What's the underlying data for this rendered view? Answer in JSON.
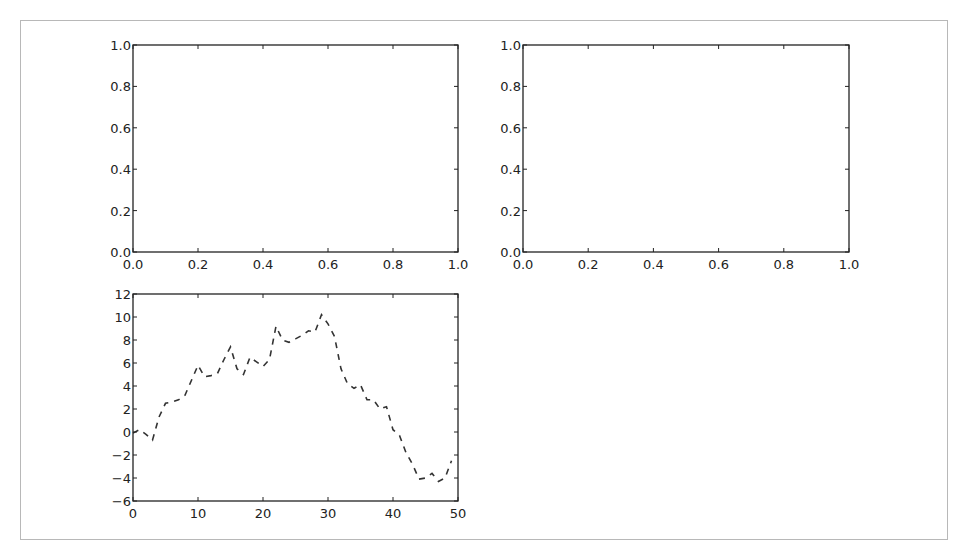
{
  "figure": {
    "layout": "2x2 subplots, bottom-right empty"
  },
  "chart_data": [
    {
      "type": "line",
      "position": "top-left",
      "title": "",
      "xlabel": "",
      "ylabel": "",
      "xlim": [
        0.0,
        1.0
      ],
      "ylim": [
        0.0,
        1.0
      ],
      "xticks": [
        "0.0",
        "0.2",
        "0.4",
        "0.6",
        "0.8",
        "1.0"
      ],
      "yticks": [
        "0.0",
        "0.2",
        "0.4",
        "0.6",
        "0.8",
        "1.0"
      ],
      "series": [],
      "grid": false
    },
    {
      "type": "line",
      "position": "top-right",
      "title": "",
      "xlabel": "",
      "ylabel": "",
      "xlim": [
        0.0,
        1.0
      ],
      "ylim": [
        0.0,
        1.0
      ],
      "xticks": [
        "0.0",
        "0.2",
        "0.4",
        "0.6",
        "0.8",
        "1.0"
      ],
      "yticks": [
        "0.0",
        "0.2",
        "0.4",
        "0.6",
        "0.8",
        "1.0"
      ],
      "series": [],
      "grid": false
    },
    {
      "type": "line",
      "position": "bottom-left",
      "title": "",
      "xlabel": "",
      "ylabel": "",
      "xlim": [
        0,
        50
      ],
      "ylim": [
        -6,
        12
      ],
      "xticks": [
        "0",
        "10",
        "20",
        "30",
        "40",
        "50"
      ],
      "yticks": [
        "-6",
        "-4",
        "-2",
        "0",
        "2",
        "4",
        "6",
        "8",
        "10",
        "12"
      ],
      "grid": false,
      "series": [
        {
          "name": "random walk",
          "style": "dashed",
          "color": "#333333",
          "x": [
            0,
            1,
            2,
            3,
            4,
            5,
            6,
            7,
            8,
            9,
            10,
            11,
            12,
            13,
            14,
            15,
            16,
            17,
            18,
            19,
            20,
            21,
            22,
            23,
            24,
            25,
            26,
            27,
            28,
            29,
            30,
            31,
            32,
            33,
            34,
            35,
            36,
            37,
            38,
            39,
            40,
            41,
            42,
            43,
            44,
            45,
            46,
            47,
            48,
            49
          ],
          "values": [
            -0.1,
            0.2,
            -0.2,
            -0.7,
            1.3,
            2.5,
            2.6,
            2.8,
            3.2,
            4.5,
            5.8,
            4.8,
            4.9,
            5.1,
            6.3,
            7.4,
            5.5,
            5.0,
            6.5,
            6.1,
            5.7,
            6.3,
            9.2,
            8.0,
            7.8,
            8.1,
            8.4,
            8.8,
            8.7,
            10.2,
            9.4,
            8.3,
            5.5,
            4.2,
            3.8,
            4.1,
            2.8,
            2.8,
            2.0,
            2.2,
            0.2,
            -0.3,
            -1.8,
            -2.8,
            -4.1,
            -4.0,
            -3.6,
            -4.3,
            -4.0,
            -2.5
          ]
        }
      ]
    }
  ]
}
